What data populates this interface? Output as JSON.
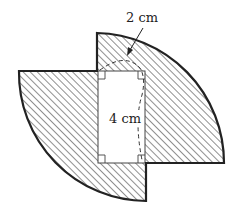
{
  "diagram": {
    "type": "geometry-figure",
    "labels": {
      "top_dimension": "2 cm",
      "middle_dimension": "4 cm"
    },
    "shapes": [
      {
        "name": "top-right quarter-circle sector",
        "fill": "hatched"
      },
      {
        "name": "bottom-left quarter-circle sector",
        "fill": "hatched"
      },
      {
        "name": "central rectangle",
        "fill": "white",
        "right_angle_marks": 4
      }
    ],
    "colors": {
      "stroke": "#222222",
      "hatch": "#333333",
      "background": "#ffffff"
    }
  }
}
